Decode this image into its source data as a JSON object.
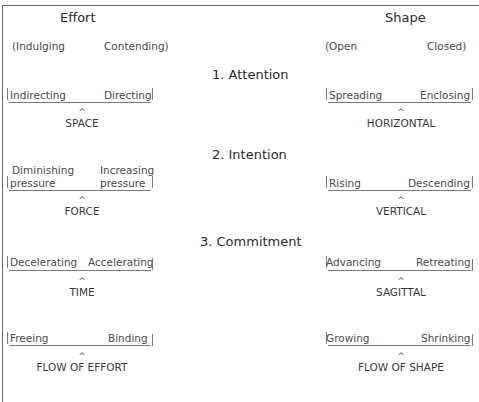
{
  "columns": {
    "left": {
      "title": "Effort",
      "poles": {
        "left": "(Indulging",
        "right": "Contending)"
      }
    },
    "right": {
      "title": "Shape",
      "poles": {
        "left": "(Open",
        "right": "Closed)"
      }
    }
  },
  "sections": [
    {
      "label": "1. Attention"
    },
    {
      "label": "2. Intention"
    },
    {
      "label": "3. Commitment"
    }
  ],
  "scales": [
    {
      "effort": {
        "left_pole": "Indirecting",
        "right_pole": "Directing",
        "factor": "SPACE"
      },
      "shape": {
        "left_pole": "Spreading",
        "right_pole": "Enclosing",
        "factor": "HORIZONTAL"
      }
    },
    {
      "effort": {
        "left_pole_line1": "Diminishing",
        "left_pole_line2": "pressure",
        "right_pole_line1": "Increasing",
        "right_pole_line2": "pressure",
        "factor": "FORCE"
      },
      "shape": {
        "left_pole": "Rising",
        "right_pole": "Descending",
        "factor": "VERTICAL"
      }
    },
    {
      "effort": {
        "left_pole": "Decelerating",
        "right_pole": "Accelerating",
        "factor": "TIME"
      },
      "shape": {
        "left_pole": "Advancing",
        "right_pole": "Retreating",
        "factor": "SAGITTAL"
      }
    },
    {
      "effort": {
        "left_pole": "Freeing",
        "right_pole": "Binding",
        "factor": "FLOW OF EFFORT"
      },
      "shape": {
        "left_pole": "Growing",
        "right_pole": "Shrinking",
        "factor": "FLOW OF SHAPE"
      }
    }
  ],
  "caret": "^"
}
